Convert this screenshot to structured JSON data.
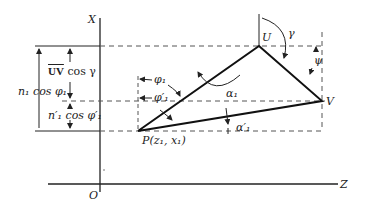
{
  "diagram": {
    "axes": {
      "x_label": "X",
      "z_label": "Z",
      "origin_label": "O"
    },
    "points": {
      "U": "U",
      "V": "V",
      "P": "P(z₁, x₁)"
    },
    "angles": {
      "gamma": "γ",
      "psi": "ψ",
      "alpha1": "α₁",
      "alpha1_prime": "α′₁",
      "phi1": "φ₁",
      "phi1_prime": "φ′₁"
    },
    "dimensions": {
      "uv_label": "UV",
      "uv_suffix": " cos γ",
      "n1": "n₁  cos φ₁",
      "n1_prime": "n′₁ cos φ′₁"
    }
  }
}
